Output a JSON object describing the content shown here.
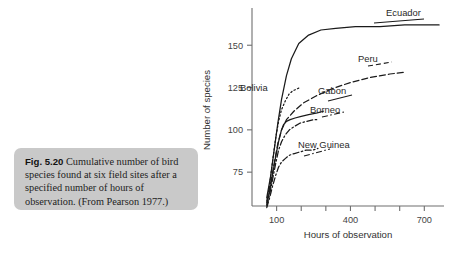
{
  "caption": {
    "label": "Fig. 5.20",
    "text": "Cumulative number of bird species found at six field sites after a specified number of hours of observation. (From Pearson 1977.)"
  },
  "chart_data": {
    "type": "line",
    "title": "",
    "xlabel": "Hours of observation",
    "ylabel": "Number of species",
    "xlim": [
      0,
      780
    ],
    "ylim": [
      55,
      172
    ],
    "grid": false,
    "legend_position": "inline-right-labels",
    "xticks": [
      100,
      200,
      300,
      400,
      500,
      600,
      700
    ],
    "xticklabels": [
      "100",
      "",
      "",
      "400",
      "",
      "",
      "700"
    ],
    "yticks": [
      75,
      100,
      125,
      150
    ],
    "yticklabels": [
      "75",
      "100",
      "125",
      "150"
    ],
    "series": [
      {
        "name": "Ecuador",
        "style": "solid",
        "x": [
          60,
          75,
          90,
          105,
          120,
          140,
          160,
          190,
          230,
          280,
          340,
          420,
          520,
          620,
          720,
          760
        ],
        "y": [
          60,
          72,
          88,
          104,
          118,
          132,
          142,
          151,
          156,
          159,
          160,
          161,
          161,
          162,
          162,
          162
        ]
      },
      {
        "name": "Peru",
        "style": "dashed",
        "x": [
          60,
          75,
          90,
          105,
          120,
          140,
          170,
          210,
          260,
          320,
          400,
          480,
          560,
          620
        ],
        "y": [
          58,
          68,
          80,
          92,
          100,
          106,
          111,
          116,
          120,
          124,
          128,
          131,
          133,
          134
        ]
      },
      {
        "name": "Bolivia",
        "style": "dotted",
        "x": [
          60,
          72,
          84,
          96,
          108,
          120,
          135,
          150,
          165,
          180,
          195
        ],
        "y": [
          57,
          68,
          82,
          95,
          105,
          112,
          117,
          121,
          123,
          124,
          125
        ]
      },
      {
        "name": "Gabon",
        "style": "solid",
        "x": [
          60,
          72,
          84,
          96,
          108,
          118,
          128,
          140,
          155,
          175,
          200,
          230,
          265,
          290
        ],
        "y": [
          56,
          64,
          74,
          84,
          93,
          99,
          103,
          105,
          106,
          107,
          108,
          109,
          110,
          111
        ]
      },
      {
        "name": "Borneo",
        "style": "dashdot",
        "x": [
          60,
          72,
          84,
          96,
          108,
          120,
          135,
          152,
          172,
          196,
          222,
          250,
          272
        ],
        "y": [
          55,
          62,
          71,
          80,
          88,
          93,
          97,
          100,
          102,
          104,
          105,
          106,
          106
        ]
      },
      {
        "name": "New Guinea",
        "style": "dashdot",
        "x": [
          60,
          72,
          84,
          96,
          108,
          120,
          135,
          152,
          172,
          196,
          220,
          245,
          268
        ],
        "y": [
          54,
          60,
          67,
          73,
          78,
          81,
          83,
          85,
          86,
          87,
          88,
          88,
          89
        ]
      }
    ],
    "annotations": [
      {
        "label": "Ecuador",
        "x_px": 386,
        "y_px": 16
      },
      {
        "label": "Peru",
        "x_px": 358,
        "y_px": 62
      },
      {
        "label": "Gabon",
        "x_px": 318,
        "y_px": 94
      },
      {
        "label": "Borneo",
        "x_px": 310,
        "y_px": 113
      },
      {
        "label": "Bolivia",
        "x_px": 240,
        "y_px": 91
      },
      {
        "label": "New Guinea",
        "x_px": 298,
        "y_px": 148
      }
    ]
  }
}
